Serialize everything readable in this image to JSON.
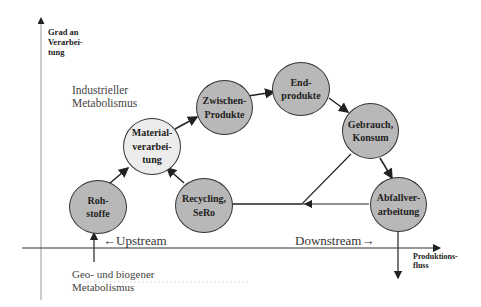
{
  "axes": {
    "y_label_lines": [
      "Grad an",
      "Verarbei-",
      "tung"
    ],
    "x_label_lines": [
      "Produktions-",
      "fluss"
    ]
  },
  "regions": {
    "industrial_lines": [
      "Industrieller",
      "Metabolismus"
    ],
    "geo_lines": [
      "Geo- und biogener",
      "Metabolismus"
    ],
    "upstream": "←Upstream",
    "downstream": "Downstream→"
  },
  "nodes": [
    {
      "id": "rohstoffe",
      "lines": [
        "Roh-",
        "stoffe"
      ],
      "fill": "#b8b8b8"
    },
    {
      "id": "materialverarbeitung",
      "lines": [
        "Material-",
        "verarbei-",
        "tung"
      ],
      "fill": "#ececec"
    },
    {
      "id": "zwischenprodukte",
      "lines": [
        "Zwischen-",
        "Produkte"
      ],
      "fill": "#b8b8b8"
    },
    {
      "id": "endprodukte",
      "lines": [
        "End-",
        "produkte"
      ],
      "fill": "#b8b8b8"
    },
    {
      "id": "gebrauch-konsum",
      "lines": [
        "Gebrauch,",
        "Konsum"
      ],
      "fill": "#b8b8b8"
    },
    {
      "id": "abfallverarbeitung",
      "lines": [
        "Abfallver-",
        "arbeitung"
      ],
      "fill": "#b8b8b8"
    },
    {
      "id": "recycling-sero",
      "lines": [
        "Recycling,",
        "SeRo"
      ],
      "fill": "#b8b8b8"
    }
  ]
}
